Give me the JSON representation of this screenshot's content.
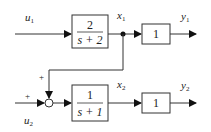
{
  "diagram": {
    "type": "block-diagram",
    "inputs": [
      {
        "label": "u",
        "sub": "1"
      },
      {
        "label": "u",
        "sub": "2"
      }
    ],
    "states": [
      {
        "label": "x",
        "sub": "1"
      },
      {
        "label": "x",
        "sub": "2"
      }
    ],
    "outputs": [
      {
        "label": "y",
        "sub": "1"
      },
      {
        "label": "y",
        "sub": "2"
      }
    ],
    "blocks": [
      {
        "id": "G1",
        "numerator": "2",
        "denominator": "s + 2"
      },
      {
        "id": "G2",
        "numerator": "1",
        "denominator": "s + 1"
      },
      {
        "id": "K1",
        "gain": "1"
      },
      {
        "id": "K2",
        "gain": "1"
      }
    ],
    "summing_junction": {
      "signs": [
        "+",
        "+"
      ]
    },
    "connections": [
      "u1 -> G1",
      "G1 -> x1",
      "x1 -> K1 -> y1",
      "x1 -> sum (+)",
      "u2 -> sum (+)",
      "sum -> G2",
      "G2 -> x2",
      "x2 -> K2 -> y2"
    ]
  }
}
